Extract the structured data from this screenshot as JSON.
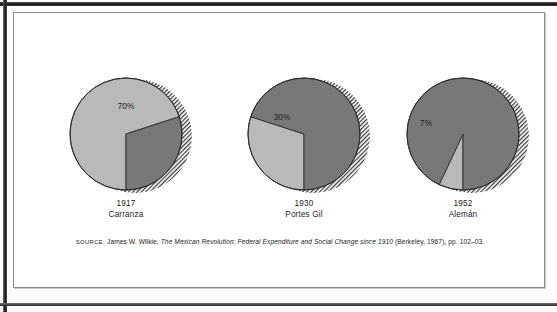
{
  "figure": {
    "source_label": "SOURCE:",
    "source_author": "James W. Wilkie,",
    "source_title": "The Mexican Revolution: Federal Expenditure and Social Change since 1910",
    "source_pub": "(Berkeley, 1967), pp. 102–03."
  },
  "colors": {
    "light_slice": "#b9b9b9",
    "dark_slice": "#787878",
    "outline": "#2d2d2d",
    "hatch": "#3a3a3a",
    "frame": "#8c8c8c",
    "text": "#1e1e1e",
    "page": "#ffffff"
  },
  "chart_data": {
    "type": "pie",
    "title": "",
    "charts": [
      {
        "id": "pie-1917",
        "year": "1917",
        "name": "Carranza",
        "label": "70%",
        "label_value": 70,
        "slices": [
          {
            "name": "highlighted",
            "value": 70,
            "fill": "light"
          },
          {
            "name": "remainder",
            "value": 30,
            "fill": "dark"
          }
        ],
        "cx": 112,
        "cy": 121,
        "r": 56,
        "start_angle_deg": 180,
        "label_x": 112,
        "label_y": 96
      },
      {
        "id": "pie-1930",
        "year": "1930",
        "name": "Portes Gil",
        "label": "30%",
        "label_value": 30,
        "slices": [
          {
            "name": "highlighted",
            "value": 30,
            "fill": "light"
          },
          {
            "name": "remainder",
            "value": 70,
            "fill": "dark"
          }
        ],
        "cx": 290,
        "cy": 121,
        "r": 56,
        "start_angle_deg": 180,
        "label_x": 268,
        "label_y": 107
      },
      {
        "id": "pie-1952",
        "year": "1952",
        "name": "Alemán",
        "label": "7%",
        "label_value": 7,
        "slices": [
          {
            "name": "highlighted",
            "value": 7,
            "fill": "light"
          },
          {
            "name": "remainder",
            "value": 93,
            "fill": "dark"
          }
        ],
        "cx": 449,
        "cy": 121,
        "r": 56,
        "start_angle_deg": 180,
        "label_x": 412,
        "label_y": 113
      }
    ]
  }
}
